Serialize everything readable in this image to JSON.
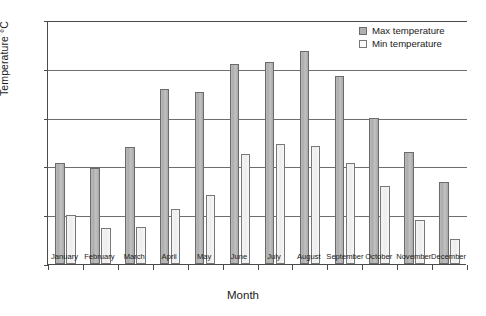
{
  "chart_data": {
    "type": "bar",
    "title": "",
    "xlabel": "Month",
    "ylabel": "Temperature °C",
    "ylim": [
      0,
      25
    ],
    "ytick_step": 5,
    "yticks": [
      "0",
      "5",
      "10",
      "15",
      "20",
      "25"
    ],
    "grid": true,
    "legend_position": "top-right",
    "categories": [
      "January",
      "February",
      "March",
      "April",
      "May",
      "June",
      "July",
      "August",
      "September",
      "October",
      "November",
      "December"
    ],
    "series": [
      {
        "name": "Max temperature",
        "color": "#b0b0b0",
        "values": [
          10.3,
          9.8,
          12.0,
          17.9,
          17.6,
          20.5,
          20.7,
          21.8,
          19.3,
          15.0,
          11.5,
          8.4
        ]
      },
      {
        "name": "Min temperature",
        "color": "#fbfbfb",
        "values": [
          5.0,
          3.7,
          3.8,
          5.6,
          7.1,
          11.3,
          12.3,
          12.1,
          10.4,
          8.0,
          4.5,
          2.6
        ]
      }
    ]
  },
  "legend": {
    "items": [
      {
        "label": "Max temperature",
        "swatch": "max"
      },
      {
        "label": "Min temperature",
        "swatch": "min"
      }
    ]
  }
}
